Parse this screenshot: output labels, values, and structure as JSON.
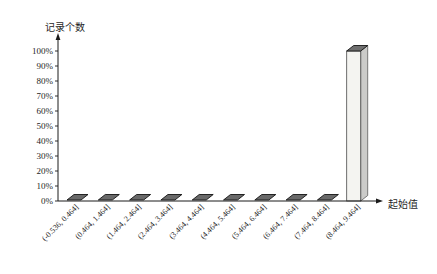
{
  "chart_data": {
    "type": "bar",
    "style": "3d-column",
    "title": "",
    "ylabel": "记录个数",
    "xlabel": "起始值",
    "categories": [
      "(-0.536, 0.464]",
      "(0.464, 1.464]",
      "(1.464, 2.464]",
      "(2.464, 3.464]",
      "(3.464, 4.464]",
      "(4.464, 5.464]",
      "(5.464, 6.464]",
      "(6.464, 7.464]",
      "(7.464, 8.464]",
      "(8.464, 9.464]"
    ],
    "values": [
      0,
      0,
      0,
      0,
      0,
      0,
      0,
      0,
      0,
      100
    ],
    "value_unit": "%",
    "y_ticks": [
      "0%",
      "10%",
      "20%",
      "30%",
      "40%",
      "50%",
      "60%",
      "70%",
      "80%",
      "90%",
      "100%"
    ],
    "ylim": [
      0,
      100
    ],
    "grid": false,
    "legend": "none",
    "colors": {
      "flat_bar_fill": "#696969",
      "flat_bar_stroke": "#141414",
      "tall_bar_front": "#f4f4f1",
      "tall_bar_side": "#cbcbc9",
      "tall_bar_top": "#6f6f6f",
      "bar_edge": "#4a4a4a",
      "axis": "#1a1a1a",
      "text": "#1f1f1f"
    }
  }
}
